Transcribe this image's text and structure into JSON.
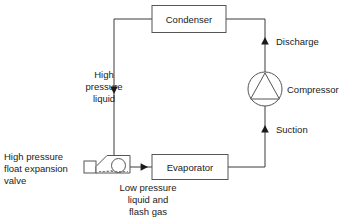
{
  "diagram": {
    "components": {
      "condenser": {
        "label": "Condenser"
      },
      "compressor": {
        "label": "Compressor"
      },
      "evaporator": {
        "label": "Evaporator"
      },
      "expansion_valve": {
        "label_line1": "High pressure",
        "label_line2": "float expansion",
        "label_line3": "valve"
      }
    },
    "flow_labels": {
      "discharge": "Discharge",
      "suction": "Suction",
      "high_pressure_liquid": {
        "line1": "High",
        "line2": "pressure",
        "line3": "liquid"
      },
      "low_pressure_mix": {
        "line1": "Low pressure",
        "line2": "liquid and",
        "line3": "flash gas"
      }
    },
    "colors": {
      "background": "#ffffff",
      "line": "#3a3a3a",
      "box_stroke": "#555555",
      "text": "#1a1a1a"
    }
  }
}
